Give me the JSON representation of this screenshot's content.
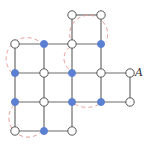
{
  "diagram": {
    "label_A": "A",
    "colors": {
      "edge": "#6b6b6b",
      "filled": "#5b7fd1",
      "open_fill": "#ffffff",
      "open_stroke": "#555555",
      "arc": "#e8a09a"
    },
    "nodes": [
      {
        "id": "n1",
        "x": 72,
        "y": 15,
        "filled": false
      },
      {
        "id": "n2",
        "x": 101,
        "y": 15,
        "filled": false
      },
      {
        "id": "n3",
        "x": 15,
        "y": 44,
        "filled": false
      },
      {
        "id": "n4",
        "x": 44,
        "y": 44,
        "filled": true
      },
      {
        "id": "n5",
        "x": 72,
        "y": 44,
        "filled": false
      },
      {
        "id": "n6",
        "x": 101,
        "y": 44,
        "filled": true
      },
      {
        "id": "n7",
        "x": 15,
        "y": 73,
        "filled": true
      },
      {
        "id": "n8",
        "x": 44,
        "y": 73,
        "filled": false
      },
      {
        "id": "n9",
        "x": 72,
        "y": 73,
        "filled": true
      },
      {
        "id": "n10",
        "x": 101,
        "y": 73,
        "filled": false
      },
      {
        "id": "A",
        "x": 130,
        "y": 73,
        "filled": false
      },
      {
        "id": "n12",
        "x": 15,
        "y": 102,
        "filled": true
      },
      {
        "id": "n13",
        "x": 44,
        "y": 102,
        "filled": false
      },
      {
        "id": "n14",
        "x": 72,
        "y": 102,
        "filled": true
      },
      {
        "id": "n15",
        "x": 101,
        "y": 102,
        "filled": true
      },
      {
        "id": "n16",
        "x": 130,
        "y": 102,
        "filled": false
      },
      {
        "id": "n17",
        "x": 15,
        "y": 131,
        "filled": false
      },
      {
        "id": "n18",
        "x": 44,
        "y": 131,
        "filled": true
      },
      {
        "id": "n19",
        "x": 72,
        "y": 131,
        "filled": false
      }
    ]
  }
}
